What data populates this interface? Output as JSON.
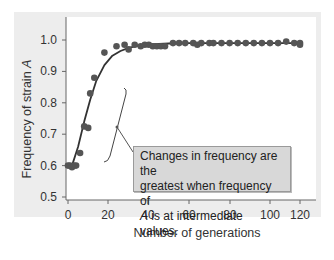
{
  "chart_data": {
    "type": "scatter",
    "title": "",
    "xlabel": "Number of generations",
    "ylabel": "Frequency of strain A",
    "ylabel_parts": {
      "prefix": "Frequency of strain ",
      "italic": "A"
    },
    "xlim": [
      0,
      120
    ],
    "ylim": [
      0.5,
      1.0
    ],
    "x_ticks": [
      0,
      20,
      40,
      60,
      80,
      100,
      120
    ],
    "y_ticks": [
      "0.5",
      "0.6",
      "0.7",
      "0.8",
      "0.9",
      "1.0"
    ],
    "grid": false,
    "legend": null,
    "series": [
      {
        "name": "Observed frequency",
        "style": "points",
        "x": [
          0,
          1,
          2,
          3,
          4,
          6,
          8,
          10,
          11,
          13,
          18,
          24,
          28,
          30,
          33,
          36,
          38,
          40,
          42,
          44,
          46,
          48,
          52,
          55,
          58,
          62,
          64,
          66,
          70,
          72,
          76,
          80,
          84,
          88,
          92,
          96,
          100,
          104,
          108,
          112,
          116,
          120
        ],
        "values": [
          0.6,
          0.6,
          0.595,
          0.6,
          0.6,
          0.64,
          0.725,
          0.72,
          0.83,
          0.88,
          0.96,
          0.98,
          0.985,
          0.97,
          0.985,
          0.98,
          0.985,
          0.985,
          0.98,
          0.98,
          0.98,
          0.98,
          0.99,
          0.99,
          0.99,
          0.99,
          0.985,
          0.99,
          0.99,
          0.99,
          0.99,
          0.99,
          0.99,
          0.99,
          0.99,
          0.99,
          0.99,
          0.99,
          0.995,
          0.99,
          0.99,
          0.985
        ]
      },
      {
        "name": "Fitted curve",
        "style": "line",
        "x": [
          2,
          5,
          8,
          11,
          14,
          18,
          22,
          26,
          30,
          35,
          40,
          50,
          60,
          80,
          100,
          120
        ],
        "values": [
          0.6,
          0.66,
          0.74,
          0.81,
          0.87,
          0.92,
          0.95,
          0.965,
          0.975,
          0.982,
          0.986,
          0.989,
          0.99,
          0.99,
          0.99,
          0.99
        ]
      }
    ],
    "annotations": [
      {
        "text_lines": [
          "Changes in frequency are the",
          "greatest when frequency of",
          "A is at intermediate values."
        ],
        "italic_leading": "A",
        "points_to": "bracket spanning steep rise (generations ~5–25)"
      }
    ]
  },
  "colors": {
    "panel_bg": "#ededed",
    "plot_bg": "#ffffff",
    "points": "#555555",
    "line": "#333333",
    "callout_bg": "#d8d8d8"
  }
}
